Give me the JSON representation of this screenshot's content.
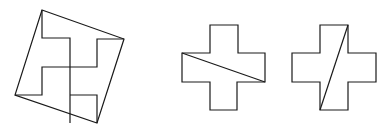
{
  "diagram": {
    "stroke_color": "#1a1a1a",
    "background_color": "#ffffff",
    "figures": [
      {
        "id": "tilted-square-with-pinwheel",
        "kind": "square with inner pinwheel dissection"
      },
      {
        "id": "cross-with-shallow-diagonal",
        "kind": "Greek cross cut by line from left arm top-left to right arm bottom-right"
      },
      {
        "id": "cross-with-steep-diagonal",
        "kind": "Greek cross cut by line from top arm top-right to bottom arm bottom-left"
      }
    ]
  }
}
